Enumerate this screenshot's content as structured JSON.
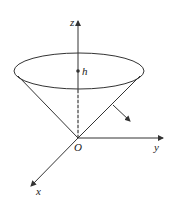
{
  "diagram": {
    "labels": {
      "z_axis": "z",
      "y_axis": "y",
      "x_axis": "x",
      "origin": "O",
      "height": "h"
    },
    "colors": {
      "stroke": "#333333",
      "background": "#ffffff"
    }
  }
}
